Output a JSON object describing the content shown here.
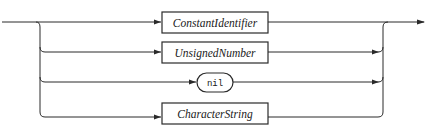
{
  "diagram": {
    "type": "syntax-diagram",
    "title": "",
    "alternatives": [
      {
        "kind": "nonterminal",
        "label": "ConstantIdentifier"
      },
      {
        "kind": "nonterminal",
        "label": "UnsignedNumber"
      },
      {
        "kind": "terminal",
        "label": "nil"
      },
      {
        "kind": "nonterminal",
        "label": "CharacterString"
      }
    ]
  },
  "colors": {
    "stroke": "#2a2a2a",
    "background": "#ffffff"
  }
}
